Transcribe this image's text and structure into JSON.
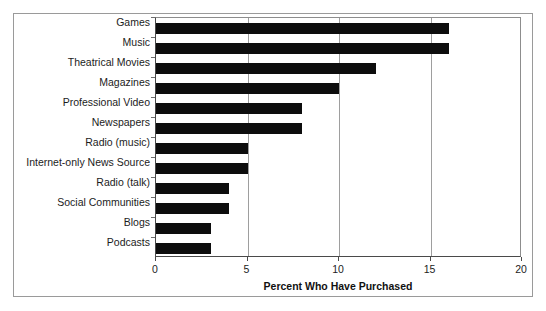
{
  "figure": {
    "frame_visible": true,
    "border_color": "#9a9a9a",
    "background_color": "#ffffff",
    "bar_color": "#0d0d0d"
  },
  "chart_data": {
    "type": "bar",
    "orientation": "horizontal",
    "title": "",
    "subtitle": "",
    "xlabel": "Percent Who Have Purchased",
    "ylabel": "",
    "xlim": [
      0,
      20
    ],
    "ylim": null,
    "grid": true,
    "grid_axis": "x",
    "legend": false,
    "legend_position": "none",
    "xticks": [
      0,
      5,
      10,
      15,
      20
    ],
    "xtick_labels": [
      "0",
      "5",
      "10",
      "15",
      "20"
    ],
    "categories": [
      "Games",
      "Music",
      "Theatrical Movies",
      "Magazines",
      "Professional Video",
      "Newspapers",
      "Radio (music)",
      "Internet-only News Source",
      "Radio (talk)",
      "Social Communities",
      "Blogs",
      "Podcasts"
    ],
    "values": [
      16,
      16,
      12,
      10,
      8,
      8,
      5,
      5,
      4,
      4,
      3,
      3
    ],
    "value_unit": "percent"
  },
  "scan": {
    "artifact_text": ""
  }
}
